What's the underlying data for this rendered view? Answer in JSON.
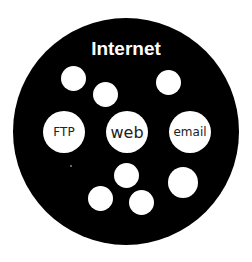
{
  "diagram": {
    "title": "Internet",
    "colors": {
      "background": "#ffffff",
      "outer_circle": "#000000",
      "nodes": "#ffffff",
      "title": "#ffffff",
      "label": "#222222"
    },
    "labeled_nodes": [
      {
        "label": "FTP"
      },
      {
        "label": "web"
      },
      {
        "label": "email"
      }
    ],
    "unlabeled_node_count": 7
  }
}
